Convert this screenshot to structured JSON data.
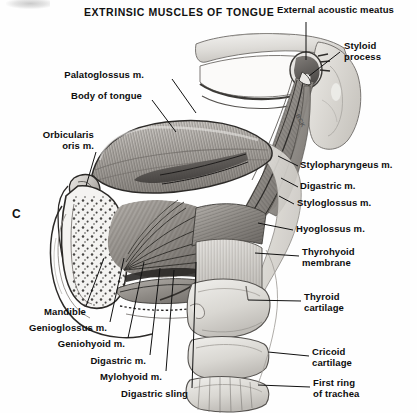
{
  "figure": {
    "title": "EXTRINSIC MUSCLES OF TONGUE",
    "panel_letter": "C",
    "artist_signature": "BCK",
    "type": "anatomical-illustration",
    "background_color": "#fefefe",
    "ink_color": "#111111"
  },
  "labels_left": [
    {
      "text": "Palatoglossus m.",
      "x": 104,
      "y": 75,
      "anchor_x": 196,
      "anchor_y": 113
    },
    {
      "text": "Body of tongue",
      "x": 90,
      "y": 95,
      "anchor_x": 176,
      "anchor_y": 132
    },
    {
      "text": "Orbicularis\noris m.",
      "x": 54,
      "y": 134,
      "anchor_x": 86,
      "anchor_y": 186
    },
    {
      "text": "Mandible",
      "x": 41,
      "y": 311,
      "anchor_x": 104,
      "anchor_y": 258
    },
    {
      "text": "Genioglossus m.",
      "x": 26,
      "y": 327,
      "anchor_x": 124,
      "anchor_y": 258
    },
    {
      "text": "Geniohyoid m.",
      "x": 47,
      "y": 343,
      "anchor_x": 144,
      "anchor_y": 262
    },
    {
      "text": "Digastric m.",
      "x": 66,
      "y": 360,
      "anchor_x": 160,
      "anchor_y": 268
    },
    {
      "text": "Mylohyoid m.",
      "x": 86,
      "y": 376,
      "anchor_x": 174,
      "anchor_y": 270
    },
    {
      "text": "Digastric sling",
      "x": 110,
      "y": 393,
      "anchor_x": 196,
      "anchor_y": 262
    }
  ],
  "labels_right": [
    {
      "text": "External acoustic meatus",
      "x": 277,
      "y": 8,
      "anchor_x": 306,
      "anchor_y": 60
    },
    {
      "text": "Styloid\nprocess",
      "x": 344,
      "y": 44,
      "anchor_x": 309,
      "anchor_y": 76
    },
    {
      "text": "Stylopharyngeus m.",
      "x": 300,
      "y": 163,
      "anchor_x": 278,
      "anchor_y": 156
    },
    {
      "text": "Digastric m.",
      "x": 300,
      "y": 184,
      "anchor_x": 281,
      "anchor_y": 178
    },
    {
      "text": "Styloglossus m.",
      "x": 297,
      "y": 201,
      "anchor_x": 279,
      "anchor_y": 196
    },
    {
      "text": "Hyoglossus m.",
      "x": 296,
      "y": 227,
      "anchor_x": 258,
      "anchor_y": 223
    },
    {
      "text": "Thyrohyoid\nmembrane",
      "x": 302,
      "y": 250,
      "anchor_x": 255,
      "anchor_y": 253
    },
    {
      "text": "Thyroid\ncartilage",
      "x": 304,
      "y": 295,
      "anchor_x": 248,
      "anchor_y": 300
    },
    {
      "text": "Cricoid\ncartilage",
      "x": 312,
      "y": 350,
      "anchor_x": 268,
      "anchor_y": 352
    },
    {
      "text": "First ring\nof trachea",
      "x": 313,
      "y": 381,
      "anchor_x": 258,
      "anchor_y": 385
    }
  ],
  "structures": [
    "tongue body",
    "palatoglossus muscle",
    "orbicularis oris muscle",
    "mandible",
    "genioglossus muscle",
    "geniohyoid muscle",
    "digastric muscle",
    "mylohyoid muscle",
    "digastric sling",
    "styloid process",
    "external acoustic meatus",
    "zygomatic arch",
    "stylopharyngeus muscle",
    "styloglossus muscle",
    "hyoglossus muscle",
    "thyrohyoid membrane",
    "thyroid cartilage",
    "cricoid cartilage",
    "first tracheal ring"
  ]
}
